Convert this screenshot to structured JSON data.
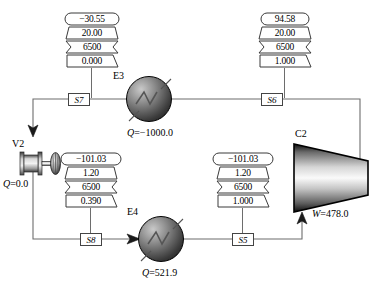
{
  "diagram": {
    "type": "process-flow-diagram"
  },
  "stream_blocks": [
    {
      "id": "block-s7",
      "stream": "S7",
      "rows": [
        "−30.55",
        "20.00",
        "6500",
        "0.000"
      ]
    },
    {
      "id": "block-s6",
      "stream": "S6",
      "rows": [
        "94.58",
        "20.00",
        "6500",
        "1.000"
      ]
    },
    {
      "id": "block-s8",
      "stream": "S8",
      "rows": [
        "−101.03",
        "1.20",
        "6500",
        "0.390"
      ]
    },
    {
      "id": "block-s5",
      "stream": "S5",
      "rows": [
        "−101.03",
        "1.20",
        "6500",
        "1.000"
      ]
    }
  ],
  "stream_labels": {
    "s7": "S7",
    "s6": "S6",
    "s8": "S8",
    "s5": "S5"
  },
  "equipment": {
    "e3": {
      "label": "E3",
      "duty_symbol": "Q",
      "duty_text": "=−1000.0",
      "duty_value": -1000.0
    },
    "e4": {
      "label": "E4",
      "duty_symbol": "Q",
      "duty_text": "=521.9",
      "duty_value": 521.9
    },
    "v2": {
      "label": "V2",
      "duty_symbol": "Q",
      "duty_text": "=0.0",
      "duty_value": 0.0
    },
    "c2": {
      "label": "C2",
      "work_symbol": "W",
      "work_text": "=478.0",
      "work_value": 478.0
    }
  },
  "colors": {
    "line": "#6d6d6d",
    "outline": "#3a3a3a",
    "text": "#000000",
    "background": "#ffffff"
  }
}
